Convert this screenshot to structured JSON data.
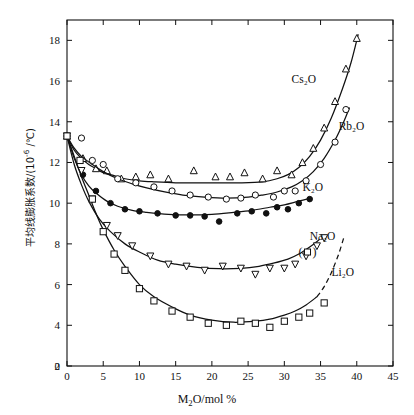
{
  "chart_data": {
    "type": "scatter",
    "title": "",
    "xlabel": "M₂O/mol %",
    "ylabel": "平均线膨胀系数 /(10⁻⁶ /°C)",
    "xlim": [
      0,
      45
    ],
    "ylim": [
      2,
      19
    ],
    "xticks": [
      0,
      5,
      10,
      15,
      20,
      25,
      30,
      35,
      40,
      45
    ],
    "yticks": [
      2,
      4,
      6,
      8,
      10,
      12,
      14,
      16,
      18
    ],
    "grid": false,
    "legend": "inline-annotations",
    "series": [
      {
        "name": "Cs₂O",
        "marker": "triangle-up",
        "label_x": 31.0,
        "label_y": 15.9,
        "points": [
          [
            0.0,
            13.3
          ],
          [
            2.2,
            12.2
          ],
          [
            4.0,
            11.7
          ],
          [
            5.5,
            11.6
          ],
          [
            7.5,
            11.2
          ],
          [
            9.5,
            11.3
          ],
          [
            11.5,
            11.4
          ],
          [
            14.0,
            11.2
          ],
          [
            17.5,
            11.6
          ],
          [
            20.5,
            11.3
          ],
          [
            22.5,
            11.3
          ],
          [
            24.5,
            11.5
          ],
          [
            27.0,
            11.2
          ],
          [
            29.0,
            11.6
          ],
          [
            31.0,
            11.4
          ],
          [
            32.5,
            12.0
          ],
          [
            34.0,
            12.7
          ],
          [
            35.5,
            13.7
          ],
          [
            37.0,
            15.0
          ],
          [
            38.5,
            16.6
          ],
          [
            40.0,
            18.1
          ]
        ],
        "curve": [
          [
            0.0,
            13.3
          ],
          [
            1.0,
            12.6
          ],
          [
            2.0,
            12.2
          ],
          [
            3.0,
            11.9
          ],
          [
            4.0,
            11.7
          ],
          [
            5.0,
            11.5
          ],
          [
            6.5,
            11.35
          ],
          [
            8.0,
            11.2
          ],
          [
            10.0,
            11.1
          ],
          [
            12.0,
            11.05
          ],
          [
            15.0,
            11.0
          ],
          [
            18.0,
            11.0
          ],
          [
            21.0,
            11.0
          ],
          [
            24.0,
            11.0
          ],
          [
            27.0,
            11.05
          ],
          [
            29.0,
            11.2
          ],
          [
            30.5,
            11.4
          ],
          [
            32.0,
            11.75
          ],
          [
            33.5,
            12.3
          ],
          [
            35.0,
            13.1
          ],
          [
            36.5,
            14.2
          ],
          [
            38.0,
            15.6
          ],
          [
            39.2,
            16.9
          ],
          [
            40.2,
            18.3
          ]
        ]
      },
      {
        "name": "Rb₂O",
        "marker": "circle-open",
        "label_x": 37.5,
        "label_y": 13.6,
        "points": [
          [
            0.0,
            13.3
          ],
          [
            2.0,
            13.2
          ],
          [
            3.5,
            12.1
          ],
          [
            5.0,
            11.9
          ],
          [
            7.0,
            11.2
          ],
          [
            9.5,
            11.0
          ],
          [
            12.0,
            10.8
          ],
          [
            14.5,
            10.6
          ],
          [
            17.0,
            10.4
          ],
          [
            19.5,
            10.3
          ],
          [
            22.0,
            10.2
          ],
          [
            24.0,
            10.25
          ],
          [
            26.0,
            10.4
          ],
          [
            28.5,
            10.3
          ],
          [
            30.0,
            10.6
          ],
          [
            31.5,
            10.6
          ],
          [
            33.0,
            11.1
          ],
          [
            35.0,
            11.9
          ],
          [
            37.0,
            13.0
          ],
          [
            38.5,
            14.6
          ]
        ],
        "curve": [
          [
            0.0,
            13.3
          ],
          [
            1.0,
            12.7
          ],
          [
            2.0,
            12.3
          ],
          [
            3.5,
            11.9
          ],
          [
            5.0,
            11.55
          ],
          [
            7.0,
            11.2
          ],
          [
            9.0,
            10.95
          ],
          [
            11.0,
            10.75
          ],
          [
            13.5,
            10.55
          ],
          [
            16.0,
            10.4
          ],
          [
            19.0,
            10.3
          ],
          [
            22.0,
            10.25
          ],
          [
            25.0,
            10.3
          ],
          [
            27.0,
            10.4
          ],
          [
            29.0,
            10.55
          ],
          [
            31.0,
            10.8
          ],
          [
            32.5,
            11.1
          ],
          [
            34.0,
            11.55
          ],
          [
            35.5,
            12.2
          ],
          [
            37.0,
            13.1
          ],
          [
            38.2,
            14.0
          ],
          [
            39.0,
            14.7
          ]
        ]
      },
      {
        "name": "K₂O",
        "marker": "circle-filled",
        "label_x": 32.5,
        "label_y": 10.6,
        "points": [
          [
            0.0,
            13.3
          ],
          [
            2.2,
            11.4
          ],
          [
            4.0,
            10.6
          ],
          [
            6.0,
            10.0
          ],
          [
            8.0,
            9.7
          ],
          [
            10.0,
            9.6
          ],
          [
            12.5,
            9.5
          ],
          [
            15.0,
            9.4
          ],
          [
            17.0,
            9.4
          ],
          [
            19.0,
            9.35
          ],
          [
            21.0,
            9.1
          ],
          [
            23.5,
            9.5
          ],
          [
            25.5,
            9.6
          ],
          [
            27.5,
            9.5
          ],
          [
            29.0,
            9.8
          ],
          [
            30.5,
            9.7
          ],
          [
            32.0,
            10.0
          ],
          [
            33.5,
            10.2
          ]
        ],
        "curve": [
          [
            0.0,
            13.3
          ],
          [
            1.0,
            12.2
          ],
          [
            2.0,
            11.4
          ],
          [
            3.0,
            10.85
          ],
          [
            4.0,
            10.5
          ],
          [
            5.5,
            10.1
          ],
          [
            7.0,
            9.85
          ],
          [
            9.0,
            9.65
          ],
          [
            11.0,
            9.55
          ],
          [
            14.0,
            9.45
          ],
          [
            17.0,
            9.42
          ],
          [
            20.0,
            9.45
          ],
          [
            23.0,
            9.55
          ],
          [
            25.5,
            9.65
          ],
          [
            28.0,
            9.8
          ],
          [
            30.0,
            9.92
          ],
          [
            32.0,
            10.1
          ],
          [
            33.8,
            10.25
          ]
        ]
      },
      {
        "name": "Na₂O",
        "marker": "triangle-down",
        "label_x": 33.5,
        "label_y": 8.2,
        "points": [
          [
            0.0,
            13.3
          ],
          [
            2.0,
            11.6
          ],
          [
            3.5,
            10.2
          ],
          [
            5.5,
            8.9
          ],
          [
            7.0,
            8.4
          ],
          [
            9.0,
            7.9
          ],
          [
            11.5,
            7.4
          ],
          [
            14.0,
            7.0
          ],
          [
            16.5,
            6.9
          ],
          [
            19.0,
            6.7
          ],
          [
            21.5,
            6.9
          ],
          [
            24.0,
            6.8
          ],
          [
            26.0,
            6.5
          ],
          [
            28.0,
            6.8
          ],
          [
            30.0,
            6.8
          ],
          [
            31.5,
            7.0
          ],
          [
            33.0,
            7.4
          ],
          [
            34.5,
            7.9
          ],
          [
            35.5,
            8.3
          ]
        ],
        "curve": [
          [
            0.0,
            13.3
          ],
          [
            1.0,
            11.9
          ],
          [
            2.0,
            10.9
          ],
          [
            3.0,
            10.1
          ],
          [
            4.5,
            9.2
          ],
          [
            6.0,
            8.6
          ],
          [
            8.0,
            8.0
          ],
          [
            10.0,
            7.6
          ],
          [
            12.5,
            7.2
          ],
          [
            15.0,
            7.0
          ],
          [
            18.0,
            6.85
          ],
          [
            21.0,
            6.78
          ],
          [
            24.0,
            6.8
          ],
          [
            26.5,
            6.9
          ],
          [
            28.5,
            7.05
          ],
          [
            30.5,
            7.25
          ],
          [
            32.0,
            7.5
          ],
          [
            33.5,
            7.85
          ],
          [
            34.8,
            8.2
          ]
        ]
      },
      {
        "name": "Li₂O",
        "marker": "square-open",
        "label_x": 36.5,
        "label_y": 6.4,
        "legend_marker_x": 33.2,
        "legend_marker_y": 7.6,
        "points": [
          [
            0.0,
            13.3
          ],
          [
            1.8,
            12.1
          ],
          [
            3.5,
            10.2
          ],
          [
            5.0,
            8.6
          ],
          [
            6.5,
            7.5
          ],
          [
            8.0,
            6.7
          ],
          [
            10.0,
            5.8
          ],
          [
            12.0,
            5.2
          ],
          [
            14.5,
            4.7
          ],
          [
            17.0,
            4.4
          ],
          [
            19.5,
            4.1
          ],
          [
            22.0,
            4.0
          ],
          [
            24.0,
            4.2
          ],
          [
            26.0,
            4.1
          ],
          [
            28.0,
            3.9
          ],
          [
            30.0,
            4.2
          ],
          [
            32.0,
            4.4
          ],
          [
            33.5,
            4.6
          ],
          [
            35.5,
            5.1
          ]
        ],
        "curve": [
          [
            0.0,
            13.3
          ],
          [
            1.0,
            12.3
          ],
          [
            2.0,
            11.3
          ],
          [
            3.0,
            10.4
          ],
          [
            4.0,
            9.5
          ],
          [
            5.0,
            8.7
          ],
          [
            6.5,
            7.7
          ],
          [
            8.0,
            6.9
          ],
          [
            10.0,
            6.0
          ],
          [
            12.0,
            5.4
          ],
          [
            14.5,
            4.9
          ],
          [
            17.0,
            4.5
          ],
          [
            20.0,
            4.25
          ],
          [
            23.0,
            4.15
          ],
          [
            26.0,
            4.2
          ],
          [
            28.0,
            4.3
          ],
          [
            30.0,
            4.5
          ],
          [
            31.5,
            4.7
          ],
          [
            33.0,
            5.0
          ],
          [
            34.5,
            5.4
          ]
        ],
        "curve_dashed": [
          [
            34.5,
            5.4
          ],
          [
            35.5,
            5.9
          ],
          [
            36.5,
            6.6
          ],
          [
            37.5,
            7.5
          ],
          [
            38.2,
            8.3
          ]
        ]
      }
    ]
  },
  "axes": {
    "x_tick_labels": [
      "0",
      "5",
      "10",
      "15",
      "20",
      "25",
      "30",
      "35",
      "40",
      "45"
    ],
    "y_tick_labels": [
      "2",
      "4",
      "6",
      "8",
      "10",
      "12",
      "14",
      "16",
      "18"
    ],
    "x_title": "M₂O/mol %",
    "y_title_main": "平均线膨胀系数",
    "y_title_unit": "/(10",
    "y_title_exp": "-6",
    "y_title_unit2": " /°C)"
  },
  "colors": {
    "axis": "#111111",
    "curve": "#111111",
    "background": "#ffffff"
  }
}
